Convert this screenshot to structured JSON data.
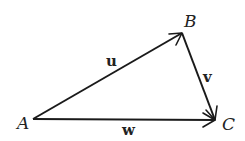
{
  "diagram": {
    "type": "vector-triangle",
    "points": [
      {
        "id": "A",
        "label": "A",
        "x": 33,
        "y": 119,
        "label_x": 17,
        "label_y": 129
      },
      {
        "id": "B",
        "label": "B",
        "x": 182,
        "y": 33,
        "label_x": 184,
        "label_y": 27
      },
      {
        "id": "C",
        "label": "C",
        "x": 215,
        "y": 120,
        "label_x": 222,
        "label_y": 130
      }
    ],
    "vectors": [
      {
        "id": "u",
        "label": "u",
        "from": "A",
        "to": "B",
        "label_x": 106,
        "label_y": 66
      },
      {
        "id": "v",
        "label": "v",
        "from": "B",
        "to": "C",
        "label_x": 203,
        "label_y": 82
      },
      {
        "id": "w",
        "label": "w",
        "from": "A",
        "to": "C",
        "label_x": 122,
        "label_y": 135
      }
    ]
  }
}
